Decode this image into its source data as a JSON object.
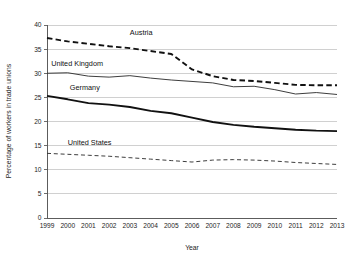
{
  "chart_data": {
    "type": "line",
    "title": "",
    "xlabel": "Year",
    "ylabel": "Percentage of workers in trade unions",
    "x": [
      1999,
      2000,
      2001,
      2002,
      2003,
      2004,
      2005,
      2006,
      2007,
      2008,
      2009,
      2010,
      2011,
      2012,
      2013
    ],
    "categories": [
      "1999",
      "2000",
      "2001",
      "2002",
      "2003",
      "2004",
      "2005",
      "2006",
      "2007",
      "2008",
      "2009",
      "2010",
      "2011",
      "2012",
      "2013"
    ],
    "xlim": [
      1999,
      2013
    ],
    "ylim": [
      0,
      40
    ],
    "y_ticks": [
      0,
      5,
      10,
      15,
      20,
      25,
      30,
      35,
      40
    ],
    "y_tick_labels": [
      "0",
      "5",
      "10",
      "15",
      "20",
      "25",
      "30",
      "35",
      "40"
    ],
    "grid": "horizontal",
    "legend_position": "inline-labels",
    "series": [
      {
        "name": "Austria",
        "style": "dashed",
        "width": "thick",
        "color": "#111111",
        "values": [
          37.3,
          36.6,
          36.1,
          35.6,
          35.2,
          34.6,
          34.0,
          30.8,
          29.4,
          28.6,
          28.4,
          28.0,
          27.6,
          27.5,
          27.5
        ]
      },
      {
        "name": "United Kingdom",
        "style": "solid",
        "width": "thin",
        "color": "#333333",
        "values": [
          30.0,
          30.1,
          29.4,
          29.2,
          29.5,
          29.0,
          28.6,
          28.3,
          28.0,
          27.2,
          27.3,
          26.6,
          25.7,
          26.0,
          25.6
        ]
      },
      {
        "name": "Germany",
        "style": "solid",
        "width": "thick",
        "color": "#111111",
        "values": [
          25.3,
          24.6,
          23.8,
          23.5,
          23.0,
          22.2,
          21.7,
          20.8,
          19.9,
          19.3,
          18.9,
          18.6,
          18.3,
          18.1,
          18.0
        ]
      },
      {
        "name": "United States",
        "style": "dashed",
        "width": "thin",
        "color": "#333333",
        "values": [
          13.4,
          13.2,
          13.0,
          12.8,
          12.5,
          12.2,
          11.9,
          11.6,
          12.0,
          12.1,
          12.0,
          11.8,
          11.5,
          11.3,
          11.1
        ]
      }
    ],
    "series_label_positions": [
      {
        "name": "Austria",
        "x": 2003.0,
        "y": 38.0
      },
      {
        "name": "United Kingdom",
        "x": 1999.2,
        "y": 31.6
      },
      {
        "name": "Germany",
        "x": 2000.1,
        "y": 26.6
      },
      {
        "name": "United States",
        "x": 2000.0,
        "y": 15.2
      }
    ]
  }
}
